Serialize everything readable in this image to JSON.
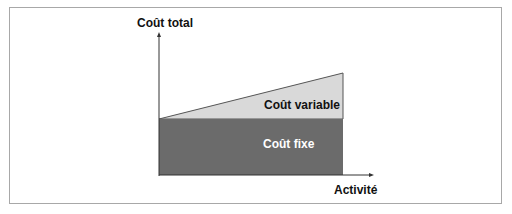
{
  "diagram": {
    "y_axis_label": "Coût total",
    "x_axis_label": "Activité",
    "regions": [
      {
        "name": "Coût variable",
        "fill": "#d9d9d9",
        "label_color": "#111111"
      },
      {
        "name": "Coût fixe",
        "fill": "#6b6b6b",
        "label_color": "#ffffff"
      }
    ]
  }
}
